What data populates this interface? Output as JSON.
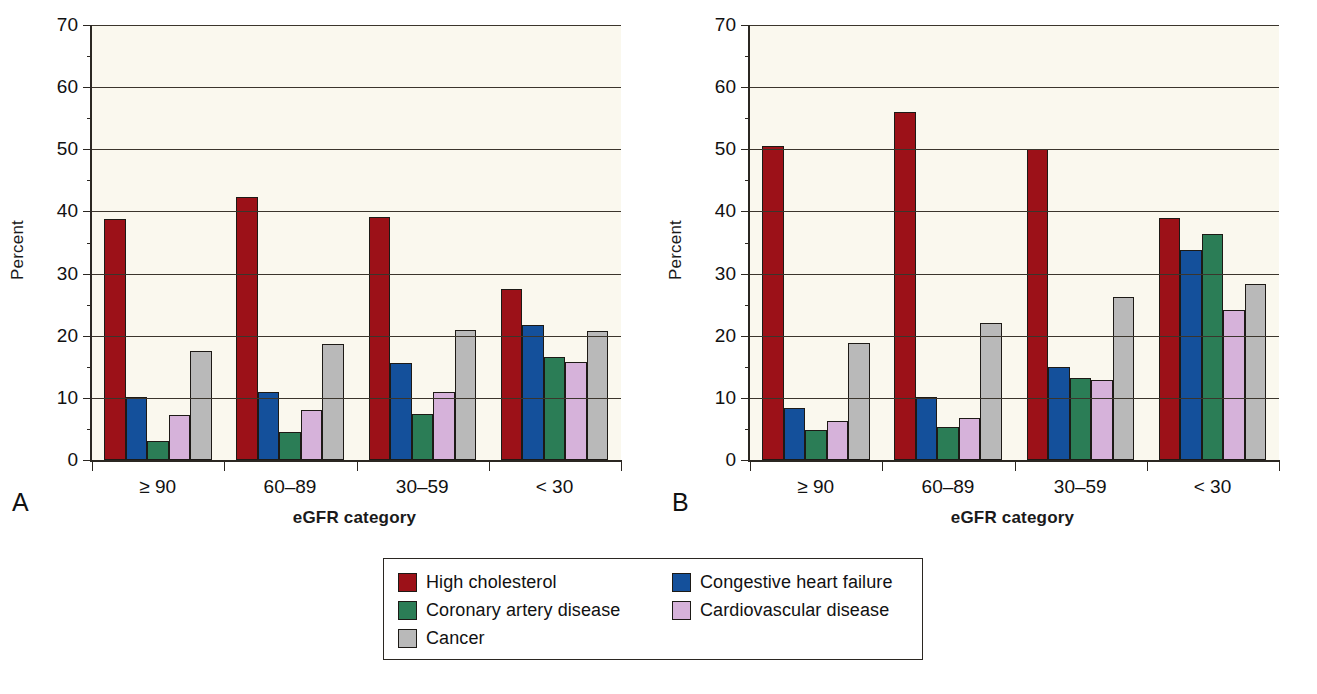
{
  "figure": {
    "panels": [
      {
        "letter": "A",
        "ylabel": "Percent",
        "xlabel": "eGFR category"
      },
      {
        "letter": "B",
        "ylabel": "Percent",
        "xlabel": "eGFR category"
      }
    ],
    "legend": {
      "entries": [
        {
          "label": "High cholesterol",
          "color": "#9c1118"
        },
        {
          "label": "Congestive heart failure",
          "color": "#14509b"
        },
        {
          "label": "Coronary artery disease",
          "color": "#2b7d56"
        },
        {
          "label": "Cardiovascular disease",
          "color": "#d6b2da"
        },
        {
          "label": "Cancer",
          "color": "#b9b9b9"
        }
      ]
    }
  },
  "chart_data": [
    {
      "type": "bar",
      "panel": "A",
      "title": "",
      "xlabel": "eGFR category",
      "ylabel": "Percent",
      "ylim": [
        0,
        70
      ],
      "yticks": [
        0,
        10,
        20,
        30,
        40,
        50,
        60,
        70
      ],
      "ytick_labels": [
        "0",
        "10",
        "20",
        "30",
        "40",
        "50",
        "60",
        "70"
      ],
      "yminor_step": 5,
      "grid": "horizontal",
      "legend_position": "below-figure",
      "categories": [
        "≥ 90",
        "60–89",
        "30–59",
        "< 30"
      ],
      "series": [
        {
          "name": "High cholesterol",
          "color": "#9c1118",
          "values": [
            38.8,
            42.4,
            39.1,
            27.5
          ]
        },
        {
          "name": "Congestive heart failure",
          "color": "#14509b",
          "values": [
            10.2,
            11.0,
            15.6,
            21.7
          ]
        },
        {
          "name": "Coronary artery disease",
          "color": "#2b7d56",
          "values": [
            3.1,
            4.5,
            7.4,
            16.6
          ]
        },
        {
          "name": "Cardiovascular disease",
          "color": "#d6b2da",
          "values": [
            7.3,
            8.1,
            10.9,
            15.7
          ]
        },
        {
          "name": "Cancer",
          "color": "#b9b9b9",
          "values": [
            17.5,
            18.6,
            21.0,
            20.7
          ]
        }
      ]
    },
    {
      "type": "bar",
      "panel": "B",
      "title": "",
      "xlabel": "eGFR category",
      "ylabel": "Percent",
      "ylim": [
        0,
        70
      ],
      "yticks": [
        0,
        10,
        20,
        30,
        40,
        50,
        60,
        70
      ],
      "ytick_labels": [
        "0",
        "10",
        "20",
        "30",
        "40",
        "50",
        "60",
        "70"
      ],
      "yminor_step": 5,
      "grid": "horizontal",
      "legend_position": "below-figure",
      "categories": [
        "≥ 90",
        "60–89",
        "30–59",
        "< 30"
      ],
      "series": [
        {
          "name": "High cholesterol",
          "color": "#9c1118",
          "values": [
            50.6,
            56.0,
            50.1,
            38.9
          ]
        },
        {
          "name": "Congestive heart failure",
          "color": "#14509b",
          "values": [
            8.3,
            10.2,
            14.9,
            33.8
          ]
        },
        {
          "name": "Coronary artery disease",
          "color": "#2b7d56",
          "values": [
            4.8,
            5.3,
            13.2,
            36.3
          ]
        },
        {
          "name": "Cardiovascular disease",
          "color": "#d6b2da",
          "values": [
            6.3,
            6.8,
            12.8,
            24.1
          ]
        },
        {
          "name": "Cancer",
          "color": "#b9b9b9",
          "values": [
            18.8,
            22.1,
            26.3,
            28.4
          ]
        }
      ]
    }
  ]
}
